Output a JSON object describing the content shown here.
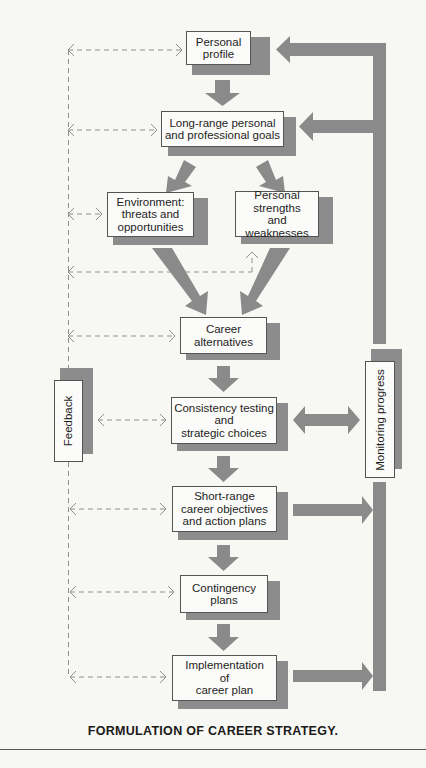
{
  "diagram": {
    "caption": "FORMULATION OF CAREER STRATEGY.",
    "colors": {
      "arrow": "#8a8a8a",
      "shadow": "#8c8c8c",
      "box_fill": "#fbfbf9",
      "box_border": "#555555",
      "dashed": "#8f8f8f",
      "background": "#f7f7f4"
    },
    "nodes": {
      "personal_profile": "Personal\nprofile",
      "long_range_goals": "Long-range personal\nand professional goals",
      "environment": "Environment:\nthreats and\nopportunities",
      "strengths_weaknesses": "Personal\nstrengths\nand weaknesses",
      "career_alternatives": "Career\nalternatives",
      "consistency_testing": "Consistency testing\nand\nstrategic choices",
      "short_range_objectives": "Short-range\ncareer objectives\nand action plans",
      "contingency_plans": "Contingency\nplans",
      "implementation": "Implementation\nof\ncareer plan",
      "feedback": "Feedback",
      "monitoring_progress": "Monitoring progress"
    },
    "flow": [
      {
        "from": "personal_profile",
        "to": "long_range_goals"
      },
      {
        "from": "long_range_goals",
        "to": "environment"
      },
      {
        "from": "long_range_goals",
        "to": "strengths_weaknesses"
      },
      {
        "from": "environment",
        "to": "career_alternatives"
      },
      {
        "from": "strengths_weaknesses",
        "to": "career_alternatives"
      },
      {
        "from": "career_alternatives",
        "to": "consistency_testing"
      },
      {
        "from": "consistency_testing",
        "to": "short_range_objectives"
      },
      {
        "from": "short_range_objectives",
        "to": "contingency_plans"
      },
      {
        "from": "contingency_plans",
        "to": "implementation"
      },
      {
        "from": "consistency_testing",
        "to": "monitoring_progress",
        "bidirectional": true
      },
      {
        "from": "short_range_objectives",
        "to": "monitoring_progress"
      },
      {
        "from": "implementation",
        "to": "monitoring_progress"
      },
      {
        "from": "monitoring_progress",
        "to": "personal_profile"
      },
      {
        "from": "monitoring_progress",
        "to": "long_range_goals"
      }
    ],
    "feedback_links": [
      "personal_profile",
      "long_range_goals",
      "environment",
      "strengths_weaknesses",
      "career_alternatives",
      "consistency_testing",
      "short_range_objectives",
      "contingency_plans",
      "implementation"
    ]
  }
}
